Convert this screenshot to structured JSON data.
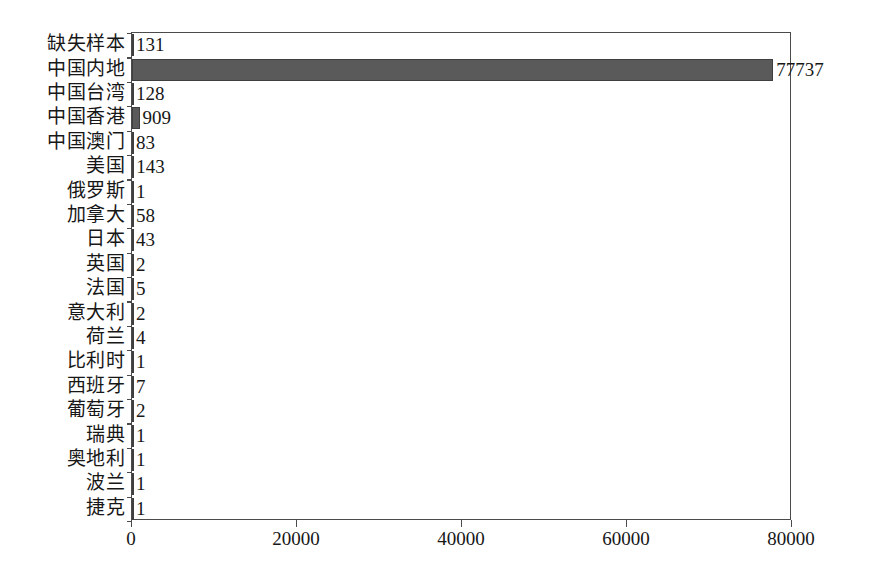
{
  "chart_data": {
    "type": "bar",
    "orientation": "horizontal",
    "title": "",
    "subtitle": "",
    "xlabel": "",
    "ylabel": "",
    "xlim": [
      0,
      80000
    ],
    "ylim": null,
    "grid": false,
    "legend": null,
    "bar_color": "#5a5a5a",
    "axis_color": "#4b4b4b",
    "background": "#ffffff",
    "xticks": [
      0,
      20000,
      40000,
      60000,
      80000
    ],
    "xtick_labels": [
      "0",
      "20000",
      "40000",
      "60000",
      "80000"
    ],
    "categories": [
      "缺失样本",
      "中国内地",
      "中国台湾",
      "中国香港",
      "中国澳门",
      "美国",
      "俄罗斯",
      "加拿大",
      "日本",
      "英国",
      "法国",
      "意大利",
      "荷兰",
      "比利时",
      "西班牙",
      "葡萄牙",
      "瑞典",
      "奥地利",
      "波兰",
      "捷克"
    ],
    "values": [
      131,
      77737,
      128,
      909,
      83,
      143,
      1,
      58,
      43,
      2,
      5,
      2,
      4,
      1,
      7,
      2,
      1,
      1,
      1,
      1
    ],
    "value_labels": [
      "131",
      "77737",
      "128",
      "909",
      "83",
      "143",
      "1",
      "58",
      "43",
      "2",
      "5",
      "2",
      "4",
      "1",
      "7",
      "2",
      "1",
      "1",
      "1",
      "1"
    ]
  }
}
